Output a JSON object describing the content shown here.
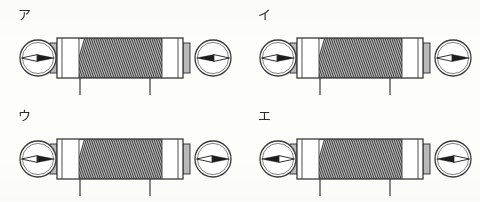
{
  "figure": {
    "background_color": "#fdfdfc",
    "line_color": "#3a3a3a",
    "coil_color": "#4a4a4a",
    "panel_count": 4,
    "panel_width": 240,
    "panel_height": 101
  },
  "panels": [
    {
      "label": "ア",
      "label_reading": "a",
      "left_compass": {
        "name": "compass-left",
        "needle_direction": "right",
        "needle_angle_deg": 0,
        "radius": 18
      },
      "right_compass": {
        "name": "compass-right",
        "needle_direction": "left",
        "needle_angle_deg": 180,
        "radius": 18
      },
      "coil": {
        "turns": 46,
        "lead_count": 2
      }
    },
    {
      "label": "イ",
      "label_reading": "i",
      "left_compass": {
        "name": "compass-left",
        "needle_direction": "right",
        "needle_angle_deg": 0,
        "radius": 18
      },
      "right_compass": {
        "name": "compass-right",
        "needle_direction": "right",
        "needle_angle_deg": 0,
        "radius": 18
      },
      "coil": {
        "turns": 46,
        "lead_count": 2
      }
    },
    {
      "label": "ウ",
      "label_reading": "u",
      "left_compass": {
        "name": "compass-left",
        "needle_direction": "right",
        "needle_angle_deg": 0,
        "radius": 18
      },
      "right_compass": {
        "name": "compass-right",
        "needle_direction": "right",
        "needle_angle_deg": 0,
        "radius": 18
      },
      "coil": {
        "turns": 46,
        "lead_count": 2
      }
    },
    {
      "label": "エ",
      "label_reading": "e",
      "left_compass": {
        "name": "compass-left",
        "needle_direction": "left",
        "needle_angle_deg": 180,
        "radius": 18
      },
      "right_compass": {
        "name": "compass-right",
        "needle_direction": "left",
        "needle_angle_deg": 180,
        "radius": 18
      },
      "coil": {
        "turns": 46,
        "lead_count": 2
      }
    }
  ]
}
